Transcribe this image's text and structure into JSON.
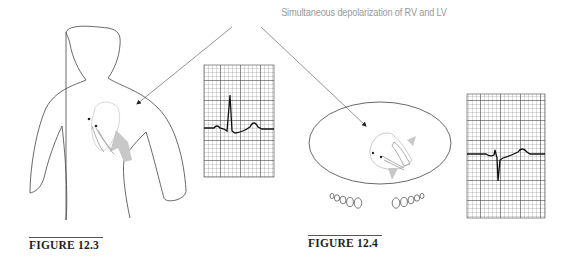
{
  "annotation": {
    "text": "Simultaneous depolarization of RV and LV",
    "color": "#9a9a9a"
  },
  "figures": [
    {
      "id": "figure-12-3",
      "label": "FIGURE 12.3",
      "view": "frontal torso silhouette with pacing leads in heart",
      "ecg": {
        "qrs": "narrow upright R wave",
        "t_wave": "upright",
        "p_wave": "small upright"
      }
    },
    {
      "id": "figure-12-4",
      "label": "FIGURE 12.4",
      "view": "transverse (cross-sectional) chest view with heart and leads",
      "ecg": {
        "qrs": "narrow deep negative (QS) deflection",
        "t_wave": "upright",
        "p_wave": "small"
      }
    }
  ],
  "colors": {
    "outline": "#444444",
    "grid": "#555555",
    "trace": "#222222",
    "heart_gray": "#bdbdbd"
  }
}
